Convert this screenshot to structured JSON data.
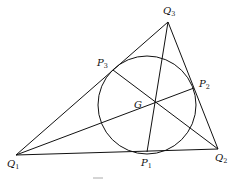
{
  "diagram": {
    "type": "geometry",
    "colors": {
      "stroke": "#111111",
      "background": "#ffffff"
    },
    "vertices": {
      "Q1": {
        "x": 16,
        "y": 155,
        "label": "Q",
        "sub": "1"
      },
      "Q2": {
        "x": 218,
        "y": 149,
        "label": "Q",
        "sub": "2"
      },
      "Q3": {
        "x": 168,
        "y": 22,
        "label": "Q",
        "sub": "3"
      }
    },
    "tangent_points": {
      "P1": {
        "x": 147,
        "y": 152,
        "label": "P",
        "sub": "1"
      },
      "P2": {
        "x": 194,
        "y": 88,
        "label": "P",
        "sub": "2"
      },
      "P3": {
        "x": 113,
        "y": 70,
        "label": "P",
        "sub": "3"
      }
    },
    "incircle": {
      "cx": 147,
      "cy": 105,
      "r": 49
    },
    "center_point": {
      "name": "G",
      "x": 155,
      "y": 102,
      "label": "G"
    }
  }
}
